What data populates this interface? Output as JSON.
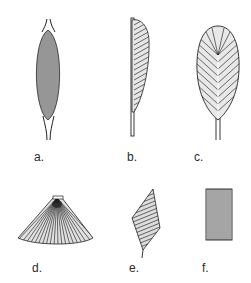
{
  "diagram": {
    "panels": [
      {
        "id": "a",
        "label": "a.",
        "shape": "fusiform"
      },
      {
        "id": "b",
        "label": "b.",
        "shape": "unipennate"
      },
      {
        "id": "c",
        "label": "c.",
        "shape": "bipennate"
      },
      {
        "id": "d",
        "label": "d.",
        "shape": "convergent / fan-shaped"
      },
      {
        "id": "e",
        "label": "e.",
        "shape": "rhomboidal"
      },
      {
        "id": "f",
        "label": "f.",
        "shape": "quadrilateral / parallel"
      }
    ],
    "colors": {
      "ink": "#1a1a1a",
      "background": "#ffffff"
    }
  }
}
